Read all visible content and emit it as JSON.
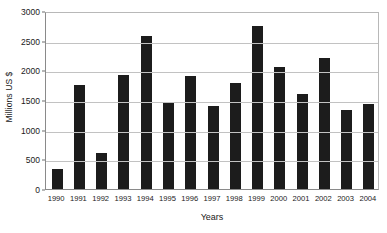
{
  "chart_data": {
    "type": "bar",
    "title": "",
    "xlabel": "Years",
    "ylabel": "Millions US $",
    "categories": [
      "1990",
      "1991",
      "1992",
      "1993",
      "1994",
      "1995",
      "1996",
      "1997",
      "1998",
      "1999",
      "2000",
      "2001",
      "2002",
      "2003",
      "2004"
    ],
    "values": [
      340,
      1760,
      600,
      1920,
      2580,
      1460,
      1900,
      1400,
      1780,
      2750,
      2050,
      1600,
      2200,
      1330,
      1440
    ],
    "ylim": [
      0,
      3000
    ],
    "yticks": [
      0,
      500,
      1000,
      1500,
      2000,
      2500,
      3000
    ],
    "ytick_labels": [
      "0",
      "500",
      "1000",
      "1500",
      "2000",
      "2500",
      "3000"
    ],
    "grid": true,
    "legend": null,
    "bar_color": "#1c1c1c",
    "grid_color": "#c2c2c2",
    "axis_color": "#8a8a8a",
    "background": "#ffffff"
  }
}
